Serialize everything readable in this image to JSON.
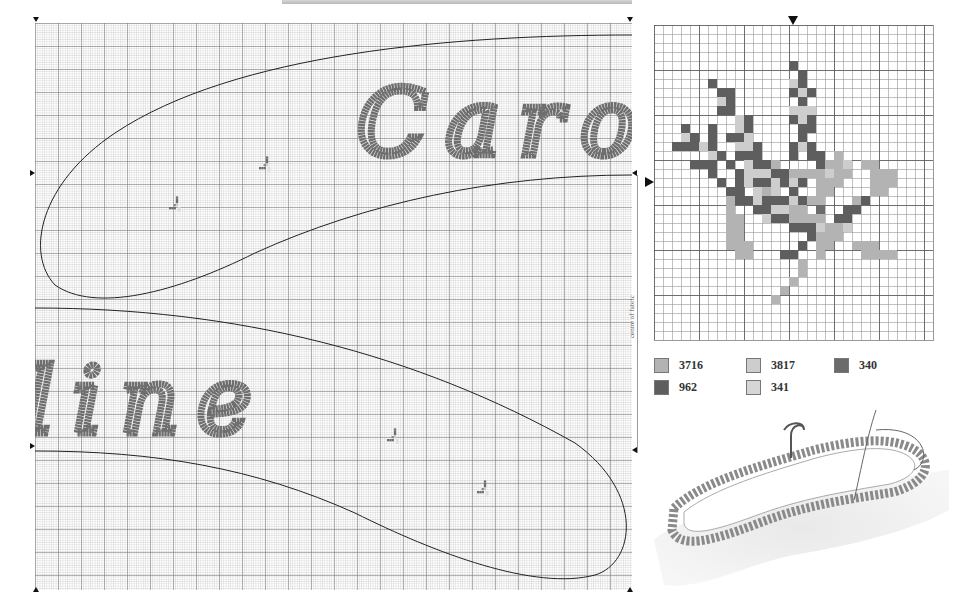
{
  "main_chart": {
    "text_top": "Caro",
    "text_bottom": "line",
    "stitch_color": "#6e6e6e",
    "outline_color": "#222222",
    "grid_minor_px": 2.3,
    "grid_major_px": 23
  },
  "centre_label": "centre of fabric",
  "motif_chart": {
    "cell_px": 9,
    "cols": 31,
    "rows": 35,
    "colors": {
      "A": "#b3b3b3",
      "B": "#cdcdcd",
      "D": "#5e5e5e",
      "E": "#6b6b6b"
    },
    "rows_data": [
      "...............................",
      "...............................",
      "...............................",
      "...............................",
      "...............D...............",
      "................D..............",
      "......D........BD..............",
      ".......DD......DBD.............",
      ".......BD.......D..............",
      ".......DD......BBB.............",
      ".........BD....DBD.............",
      "...D..D..BD.....DD.............",
      "...BD.D.DDB.....D..............",
      "..DDDBD..BBD...DBD.............",
      "......BD.DDD...D.DD.A..........",
      "....DDD.D.BDDA....DAAB.AA......",
      "......D..DBBBDDAAAABAA..AAA....",
      ".......D.DBDDBDBD.AAA...AAA....",
      "........DD.BAB.D..AA....AA.....",
      "........ADDBDDDBDAA...AD.......",
      "........A..DDBBAA.E..DD........",
      "........AA..BDDAAAA.DD.........",
      "........AA.....DDDBAAB.........",
      "........AA.......DAAA..........",
      "........AAA.....D.AA..AAA......",
      ".........AA...DD..A....AAAA....",
      "................A..............",
      "................A..............",
      "...............A...............",
      "..............A................",
      ".............A.................",
      "...............................",
      "...............................",
      "...............................",
      "..............................."
    ]
  },
  "legend": [
    {
      "code": "3716",
      "color": "#b3b3b3"
    },
    {
      "code": "3817",
      "color": "#cdcdcd"
    },
    {
      "code": "340",
      "color": "#6b6b6b"
    },
    {
      "code": "962",
      "color": "#5e5e5e"
    },
    {
      "code": "341",
      "color": "#d6d6d6"
    }
  ],
  "illustration": {
    "alt": "Padded coat hanger with ruffled trim being stitched"
  }
}
